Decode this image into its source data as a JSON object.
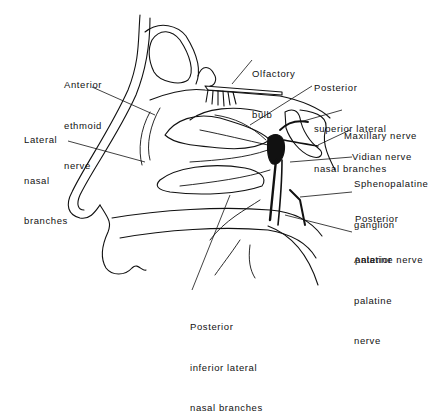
{
  "figure": {
    "line_color": "#111111",
    "background": "#ffffff"
  },
  "labels": {
    "anterior_ethmoid": [
      "Anterior",
      "ethmoid",
      "nerve"
    ],
    "lateral_nasal": [
      "Lateral",
      "nasal",
      "branches"
    ],
    "olfactory_bulb": [
      "Olfactory",
      "bulb"
    ],
    "post_sup_lateral": [
      "Posterior",
      "superior lateral",
      "nasal branches"
    ],
    "maxillary": [
      "Maxillary nerve"
    ],
    "vidian": [
      "Vidian nerve"
    ],
    "sphenopalatine": [
      "Sphenopalatine",
      "ganglion"
    ],
    "posterior_palatine": [
      "Posterior",
      "palatine nerve"
    ],
    "anterior_palatine": [
      "Anterior",
      "palatine",
      "nerve"
    ],
    "post_inf_lateral": [
      "Posterior",
      "inferior lateral",
      "nasal branches"
    ]
  }
}
